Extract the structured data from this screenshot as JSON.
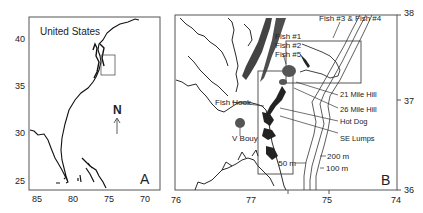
{
  "panel_a": {
    "label": "A",
    "region_label": "United States",
    "north_label": "N",
    "y_ticks": [
      "40",
      "35",
      "30",
      "25"
    ],
    "x_ticks": [
      "85",
      "80",
      "75",
      "70"
    ]
  },
  "panel_b": {
    "label": "B",
    "y_ticks": [
      "38",
      "37",
      "36"
    ],
    "x_ticks": [
      "76",
      "77",
      "75",
      "74"
    ],
    "annotations": {
      "fish_1": "Fish #1",
      "fish_2": "Fish #2",
      "fish_5": "Fish #5",
      "fish_3_4": "Fish #3 & Fish #4",
      "fish_hook": "Fish Hook",
      "v_bouy": "V Bouy",
      "mile_21": "21 Mile Hill",
      "mile_26": "26 Mile Hill",
      "hot_dog": "Hot Dog",
      "se_lumps": "SE Lumps",
      "depth_50": "50 m",
      "depth_200": "200 m",
      "depth_100": "100 m"
    }
  },
  "colors": {
    "frame": "#555555",
    "coast": "#111111",
    "sites": "#555555"
  }
}
